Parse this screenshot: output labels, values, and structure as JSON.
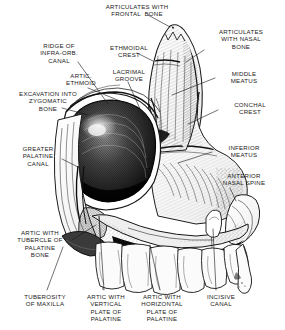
{
  "figure": {
    "background_color": "#ffffff",
    "ink_color": "#1a1a1a",
    "width": 285,
    "height": 330
  },
  "labels": [
    {
      "id": "articulates-with-frontal-bone",
      "lines": "ARTICULATES WITH\nFRONTAL  BONE",
      "x": 88,
      "y": 3,
      "align": "center",
      "width": 98
    },
    {
      "id": "articulates-with-nasal-bone",
      "lines": "ARTICULATES\nWITH NASAL\nBONE",
      "x": 205,
      "y": 28,
      "align": "center",
      "width": 72
    },
    {
      "id": "ridge-of-infra-orb-canal",
      "lines": "RIDGE OF\nINFRA-ORB.\nCANAL",
      "x": 28,
      "y": 42,
      "align": "center",
      "width": 62
    },
    {
      "id": "ethmoidal-crest",
      "lines": "ETHMOIDAL\nCREST",
      "x": 99,
      "y": 44,
      "align": "center",
      "width": 60
    },
    {
      "id": "lacrimal-groove",
      "lines": "LACRIMAL\nGROOVE",
      "x": 101,
      "y": 68,
      "align": "center",
      "width": 56
    },
    {
      "id": "artic-ethmoid",
      "lines": "ARTIC.\nETHMOID",
      "x": 55,
      "y": 72,
      "align": "center",
      "width": 52
    },
    {
      "id": "middle-meatus",
      "lines": "MIDDLE\nMEATUS",
      "x": 219,
      "y": 70,
      "align": "center",
      "width": 50
    },
    {
      "id": "excavation-into-zygomatic-bone",
      "lines": "EXCAVATION INTO\nZYGOMATIC\nBONE",
      "x": 4,
      "y": 90,
      "align": "center",
      "width": 88
    },
    {
      "id": "conchal-crest",
      "lines": "CONCHAL\nCREST",
      "x": 223,
      "y": 101,
      "align": "center",
      "width": 54
    },
    {
      "id": "greater-palatine-canal",
      "lines": "GREATER\nPALATINE\nCANAL",
      "x": 7,
      "y": 145,
      "align": "center",
      "width": 62
    },
    {
      "id": "inferior-meatus",
      "lines": "INFERIOR\nMEATUS",
      "x": 216,
      "y": 144,
      "align": "center",
      "width": 56
    },
    {
      "id": "anterior-nasal-spine",
      "lines": "ANTERIOR\nNASAL SPINE",
      "x": 210,
      "y": 172,
      "align": "center",
      "width": 68
    },
    {
      "id": "artic-with-tubercle-of-palatine-bone",
      "lines": "ARTIC WITH\nTUBERCLE OF\nPALATINE\nBONE",
      "x": 4,
      "y": 229,
      "align": "center",
      "width": 72
    },
    {
      "id": "tuberosity-of-maxilla",
      "lines": "TUBEROSITY\nOF MAXILLA",
      "x": 13,
      "y": 293,
      "align": "center",
      "width": 64
    },
    {
      "id": "artic-with-vertical-plate-of-palatine",
      "lines": "ARTIC WITH\nVERTICAL\nPLATE OF\nPALATINE",
      "x": 78,
      "y": 293,
      "align": "center",
      "width": 56
    },
    {
      "id": "artic-with-horizontal-plate-of-palatine",
      "lines": "ARTIC WITH\nHORIZONTAL\nPLATE OF\nPALATINE",
      "x": 131,
      "y": 293,
      "align": "center",
      "width": 62
    },
    {
      "id": "incisive-canal",
      "lines": "INCISIVE\nCANAL",
      "x": 196,
      "y": 293,
      "align": "center",
      "width": 50
    }
  ],
  "leader_lines": [
    {
      "id": "leader-frontal-bone",
      "from": [
        148,
        15
      ],
      "to": [
        170,
        27
      ]
    },
    {
      "id": "leader-nasal-bone",
      "from": [
        204,
        50
      ],
      "to": [
        186,
        62
      ]
    },
    {
      "id": "leader-infra-orb-canal",
      "from": [
        78,
        62
      ],
      "to": [
        108,
        104
      ]
    },
    {
      "id": "leader-ethmoidal-crest",
      "from": [
        137,
        53
      ],
      "to": [
        153,
        61
      ]
    },
    {
      "id": "leader-lacrimal-groove",
      "from": [
        128,
        82
      ],
      "to": [
        145,
        120
      ]
    },
    {
      "id": "leader-artic-ethmoid",
      "from": [
        88,
        88
      ],
      "to": [
        120,
        101
      ]
    },
    {
      "id": "leader-middle-meatus",
      "from": [
        215,
        78
      ],
      "to": [
        172,
        95
      ]
    },
    {
      "id": "leader-excavation-zygomatic",
      "from": [
        62,
        108
      ],
      "to": [
        88,
        115
      ]
    },
    {
      "id": "leader-conchal-crest",
      "from": [
        218,
        110
      ],
      "to": [
        188,
        124
      ]
    },
    {
      "id": "leader-greater-palatine-canal",
      "from": [
        62,
        159
      ],
      "to": [
        80,
        168
      ]
    },
    {
      "id": "leader-inferior-meatus",
      "from": [
        212,
        152
      ],
      "to": [
        178,
        163
      ]
    },
    {
      "id": "leader-anterior-nasal-spine",
      "from": [
        230,
        188
      ],
      "to": [
        236,
        201
      ]
    },
    {
      "id": "leader-artic-tubercle-palatine",
      "from": [
        72,
        240
      ],
      "to": [
        96,
        225
      ]
    },
    {
      "id": "leader-tuberosity-maxilla",
      "from": [
        47,
        290
      ],
      "to": [
        63,
        247
      ]
    },
    {
      "id": "leader-vertical-plate-palatine",
      "from": [
        104,
        290
      ],
      "to": [
        99,
        216
      ]
    },
    {
      "id": "leader-horizontal-plate-palatine",
      "from": [
        160,
        290
      ],
      "to": [
        150,
        245
      ]
    },
    {
      "id": "leader-incisive-canal",
      "from": [
        216,
        290
      ],
      "to": [
        213,
        229
      ]
    }
  ]
}
